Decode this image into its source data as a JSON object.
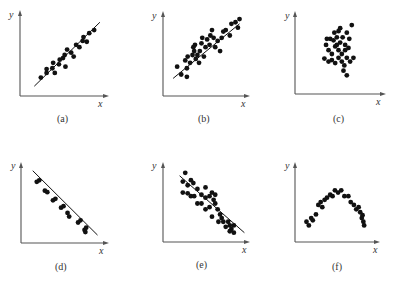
{
  "chart_data": [
    {
      "type": "scatter",
      "panel": "(a)",
      "title": "",
      "xlabel": "x",
      "ylabel": "y",
      "description": "Strong positive linear correlation, tight scatter around fit line",
      "fit_line": {
        "x1": 0.15,
        "y1": 0.1,
        "x2": 0.95,
        "y2": 0.92
      },
      "points": [
        [
          0.23,
          0.21
        ],
        [
          0.3,
          0.27
        ],
        [
          0.3,
          0.32
        ],
        [
          0.37,
          0.33
        ],
        [
          0.4,
          0.27
        ],
        [
          0.38,
          0.4
        ],
        [
          0.45,
          0.38
        ],
        [
          0.46,
          0.44
        ],
        [
          0.5,
          0.46
        ],
        [
          0.53,
          0.35
        ],
        [
          0.52,
          0.5
        ],
        [
          0.6,
          0.53
        ],
        [
          0.63,
          0.48
        ],
        [
          0.66,
          0.63
        ],
        [
          0.7,
          0.6
        ],
        [
          0.74,
          0.68
        ],
        [
          0.75,
          0.73
        ],
        [
          0.79,
          0.67
        ],
        [
          0.82,
          0.78
        ],
        [
          0.88,
          0.82
        ],
        [
          0.55,
          0.57
        ]
      ],
      "xlim": [
        0,
        1
      ],
      "ylim": [
        0,
        1
      ],
      "grid": false
    },
    {
      "type": "scatter",
      "panel": "(b)",
      "xlabel": "x",
      "ylabel": "y",
      "description": "Positive linear correlation, moderate scatter",
      "fit_line": {
        "x1": 0.1,
        "y1": 0.2,
        "x2": 0.92,
        "y2": 0.9
      },
      "points": [
        [
          0.15,
          0.35
        ],
        [
          0.2,
          0.25
        ],
        [
          0.27,
          0.22
        ],
        [
          0.27,
          0.33
        ],
        [
          0.25,
          0.43
        ],
        [
          0.28,
          0.48
        ],
        [
          0.31,
          0.4
        ],
        [
          0.34,
          0.5
        ],
        [
          0.35,
          0.6
        ],
        [
          0.36,
          0.55
        ],
        [
          0.37,
          0.63
        ],
        [
          0.4,
          0.5
        ],
        [
          0.43,
          0.55
        ],
        [
          0.45,
          0.65
        ],
        [
          0.48,
          0.48
        ],
        [
          0.5,
          0.6
        ],
        [
          0.52,
          0.7
        ],
        [
          0.55,
          0.63
        ],
        [
          0.56,
          0.75
        ],
        [
          0.6,
          0.72
        ],
        [
          0.62,
          0.6
        ],
        [
          0.65,
          0.68
        ],
        [
          0.68,
          0.55
        ],
        [
          0.7,
          0.72
        ],
        [
          0.72,
          0.8
        ],
        [
          0.75,
          0.82
        ],
        [
          0.8,
          0.75
        ],
        [
          0.82,
          0.9
        ],
        [
          0.87,
          0.92
        ],
        [
          0.9,
          0.85
        ],
        [
          0.92,
          0.96
        ],
        [
          0.38,
          0.45
        ],
        [
          0.42,
          0.4
        ],
        [
          0.58,
          0.82
        ],
        [
          0.46,
          0.72
        ]
      ],
      "xlim": [
        0,
        1
      ],
      "ylim": [
        0,
        1
      ],
      "grid": false
    },
    {
      "type": "scatter",
      "panel": "(c)",
      "xlabel": "x",
      "ylabel": "y",
      "description": "No correlation, compact cluster, no fit line",
      "fit_line": null,
      "points": [
        [
          0.35,
          0.62
        ],
        [
          0.4,
          0.7
        ],
        [
          0.45,
          0.78
        ],
        [
          0.48,
          0.72
        ],
        [
          0.5,
          0.8
        ],
        [
          0.52,
          0.65
        ],
        [
          0.55,
          0.72
        ],
        [
          0.58,
          0.62
        ],
        [
          0.6,
          0.78
        ],
        [
          0.63,
          0.7
        ],
        [
          0.66,
          0.88
        ],
        [
          0.38,
          0.55
        ],
        [
          0.42,
          0.5
        ],
        [
          0.46,
          0.6
        ],
        [
          0.5,
          0.55
        ],
        [
          0.54,
          0.5
        ],
        [
          0.58,
          0.55
        ],
        [
          0.62,
          0.58
        ],
        [
          0.33,
          0.44
        ],
        [
          0.38,
          0.4
        ],
        [
          0.42,
          0.42
        ],
        [
          0.46,
          0.38
        ],
        [
          0.5,
          0.45
        ],
        [
          0.54,
          0.4
        ],
        [
          0.57,
          0.35
        ],
        [
          0.6,
          0.45
        ],
        [
          0.64,
          0.4
        ],
        [
          0.68,
          0.45
        ],
        [
          0.56,
          0.28
        ],
        [
          0.6,
          0.22
        ],
        [
          0.44,
          0.68
        ],
        [
          0.52,
          0.84
        ],
        [
          0.48,
          0.62
        ],
        [
          0.36,
          0.7
        ]
      ],
      "xlim": [
        0,
        1
      ],
      "ylim": [
        0,
        1
      ],
      "grid": false
    },
    {
      "type": "scatter",
      "panel": "(d)",
      "xlabel": "x",
      "ylabel": "y",
      "description": "Strong negative linear correlation, points in tight pairs along fit line",
      "fit_line": {
        "x1": 0.12,
        "y1": 0.95,
        "x2": 0.92,
        "y2": 0.08
      },
      "points": [
        [
          0.17,
          0.8
        ],
        [
          0.2,
          0.82
        ],
        [
          0.27,
          0.68
        ],
        [
          0.3,
          0.66
        ],
        [
          0.37,
          0.55
        ],
        [
          0.4,
          0.57
        ],
        [
          0.47,
          0.45
        ],
        [
          0.5,
          0.47
        ],
        [
          0.55,
          0.38
        ],
        [
          0.57,
          0.33
        ],
        [
          0.68,
          0.25
        ],
        [
          0.71,
          0.28
        ],
        [
          0.76,
          0.15
        ],
        [
          0.78,
          0.18
        ],
        [
          0.77,
          0.12
        ]
      ],
      "xlim": [
        0,
        1
      ],
      "ylim": [
        0,
        1
      ],
      "grid": false
    },
    {
      "type": "scatter",
      "panel": "(e)",
      "xlabel": "x",
      "ylabel": "y",
      "description": "Negative linear correlation, moderate scatter",
      "fit_line": {
        "x1": 0.18,
        "y1": 0.88,
        "x2": 0.98,
        "y2": 0.1
      },
      "points": [
        [
          0.25,
          0.92
        ],
        [
          0.22,
          0.8
        ],
        [
          0.28,
          0.75
        ],
        [
          0.32,
          0.82
        ],
        [
          0.35,
          0.78
        ],
        [
          0.22,
          0.65
        ],
        [
          0.28,
          0.64
        ],
        [
          0.32,
          0.6
        ],
        [
          0.36,
          0.6
        ],
        [
          0.4,
          0.7
        ],
        [
          0.45,
          0.62
        ],
        [
          0.5,
          0.72
        ],
        [
          0.5,
          0.58
        ],
        [
          0.55,
          0.6
        ],
        [
          0.58,
          0.65
        ],
        [
          0.6,
          0.55
        ],
        [
          0.62,
          0.5
        ],
        [
          0.4,
          0.5
        ],
        [
          0.45,
          0.5
        ],
        [
          0.5,
          0.42
        ],
        [
          0.55,
          0.45
        ],
        [
          0.58,
          0.32
        ],
        [
          0.65,
          0.42
        ],
        [
          0.68,
          0.35
        ],
        [
          0.7,
          0.3
        ],
        [
          0.72,
          0.25
        ],
        [
          0.66,
          0.25
        ],
        [
          0.78,
          0.25
        ],
        [
          0.8,
          0.2
        ],
        [
          0.75,
          0.18
        ],
        [
          0.82,
          0.15
        ],
        [
          0.85,
          0.2
        ],
        [
          0.8,
          0.12
        ],
        [
          0.85,
          0.1
        ],
        [
          0.62,
          0.62
        ]
      ],
      "xlim": [
        0,
        1
      ],
      "ylim": [
        0,
        1
      ],
      "grid": false
    },
    {
      "type": "scatter",
      "panel": "(f)",
      "xlabel": "x",
      "ylabel": "y",
      "description": "Nonlinear inverted-U (parabolic) relationship, no fit line",
      "fit_line": null,
      "points": [
        [
          0.12,
          0.25
        ],
        [
          0.15,
          0.2
        ],
        [
          0.18,
          0.3
        ],
        [
          0.2,
          0.27
        ],
        [
          0.24,
          0.35
        ],
        [
          0.27,
          0.48
        ],
        [
          0.3,
          0.52
        ],
        [
          0.32,
          0.45
        ],
        [
          0.35,
          0.55
        ],
        [
          0.38,
          0.58
        ],
        [
          0.42,
          0.62
        ],
        [
          0.45,
          0.6
        ],
        [
          0.48,
          0.68
        ],
        [
          0.52,
          0.65
        ],
        [
          0.56,
          0.68
        ],
        [
          0.6,
          0.6
        ],
        [
          0.65,
          0.6
        ],
        [
          0.68,
          0.52
        ],
        [
          0.72,
          0.48
        ],
        [
          0.75,
          0.42
        ],
        [
          0.78,
          0.45
        ],
        [
          0.8,
          0.38
        ],
        [
          0.82,
          0.3
        ],
        [
          0.84,
          0.25
        ],
        [
          0.85,
          0.2
        ],
        [
          0.83,
          0.34
        ]
      ],
      "xlim": [
        0,
        1
      ],
      "ylim": [
        0,
        1
      ],
      "grid": false
    }
  ],
  "panels": [
    {
      "caption": "(a)",
      "x_label": "x",
      "y_label": "y"
    },
    {
      "caption": "(b)",
      "x_label": "x",
      "y_label": "y"
    },
    {
      "caption": "(c)",
      "x_label": "x",
      "y_label": "y"
    },
    {
      "caption": "(d)",
      "x_label": "x",
      "y_label": "y"
    },
    {
      "caption": "(e)",
      "x_label": "x",
      "y_label": "y"
    },
    {
      "caption": "(f)",
      "x_label": "x",
      "y_label": "y"
    }
  ],
  "colors": {
    "axis": "#555555",
    "dot": "#111111",
    "line": "#111111"
  }
}
